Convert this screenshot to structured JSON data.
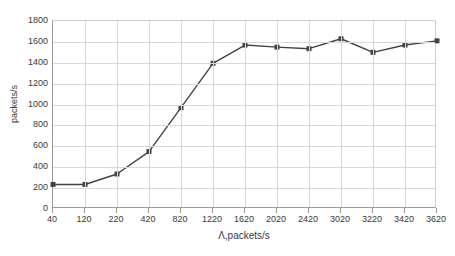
{
  "chart_data": {
    "type": "line",
    "title": "",
    "subtitle": "",
    "xlabel": "Λ,packets/s",
    "ylabel": "packets/s",
    "categories": [
      "40",
      "120",
      "220",
      "420",
      "820",
      "1220",
      "1620",
      "2020",
      "2420",
      "3020",
      "3220",
      "3420",
      "3620"
    ],
    "values": [
      235,
      235,
      335,
      550,
      970,
      1395,
      1570,
      1550,
      1535,
      1630,
      1500,
      1570,
      1610
    ],
    "series": [
      {
        "name": "packets/s",
        "values": [
          235,
          235,
          335,
          550,
          970,
          1395,
          1570,
          1550,
          1535,
          1630,
          1500,
          1570,
          1610
        ]
      }
    ],
    "ylim": [
      0,
      1800
    ],
    "yticks": [
      0,
      200,
      400,
      600,
      800,
      1000,
      1200,
      1400,
      1600,
      1800
    ],
    "ytick_labels": [
      "0",
      "200",
      "400",
      "600",
      "800",
      "1000",
      "1200",
      "1400",
      "1600",
      "1800"
    ],
    "xtick_labels": [
      "40",
      "120",
      "220",
      "420",
      "820",
      "1220",
      "1620",
      "2020",
      "2420",
      "3020",
      "3220",
      "3420",
      "3620"
    ],
    "grid": {
      "x": true,
      "y": true
    },
    "legend": {
      "visible": false,
      "position": "none"
    },
    "marker": {
      "shape": "square",
      "size": 5,
      "color": "#434343"
    },
    "line": {
      "color": "#434343",
      "width": 1.4
    },
    "axis_color": "#9a9a9a",
    "grid_color": "#d8d8d8",
    "background": "#ffffff"
  }
}
